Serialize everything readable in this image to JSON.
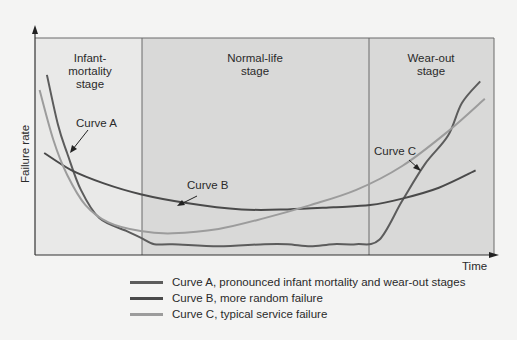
{
  "chart_data": {
    "type": "line",
    "title": "",
    "xlabel": "Time",
    "ylabel": "Failure rate",
    "grid": false,
    "legend_position": "bottom",
    "stages": [
      {
        "label": "Infant-\nmortality\nstage",
        "x_start": 0,
        "x_end": 0.233
      },
      {
        "label": "Normal-life\nstage",
        "x_start": 0.233,
        "x_end": 0.728
      },
      {
        "label": "Wear-out\nstage",
        "x_start": 0.728,
        "x_end": 1.0
      }
    ],
    "series": [
      {
        "name": "Curve A",
        "legend": "Curve A, pronounced infant mortality and wear-out stages",
        "color": "#5c5c5c",
        "points": [
          [
            0.026,
            0.83
          ],
          [
            0.05,
            0.6
          ],
          [
            0.07,
            0.47
          ],
          [
            0.1,
            0.3
          ],
          [
            0.14,
            0.17
          ],
          [
            0.2,
            0.11
          ],
          [
            0.23,
            0.08
          ],
          [
            0.26,
            0.05
          ],
          [
            0.3,
            0.05
          ],
          [
            0.4,
            0.04
          ],
          [
            0.5,
            0.05
          ],
          [
            0.55,
            0.05
          ],
          [
            0.6,
            0.04
          ],
          [
            0.65,
            0.05
          ],
          [
            0.7,
            0.05
          ],
          [
            0.75,
            0.07
          ],
          [
            0.8,
            0.25
          ],
          [
            0.85,
            0.42
          ],
          [
            0.9,
            0.55
          ],
          [
            0.93,
            0.7
          ],
          [
            0.97,
            0.8
          ]
        ]
      },
      {
        "name": "Curve B",
        "legend": "Curve B, more random failure",
        "color": "#4a4a4a",
        "points": [
          [
            0.02,
            0.47
          ],
          [
            0.08,
            0.39
          ],
          [
            0.15,
            0.33
          ],
          [
            0.23,
            0.28
          ],
          [
            0.33,
            0.24
          ],
          [
            0.45,
            0.21
          ],
          [
            0.55,
            0.21
          ],
          [
            0.65,
            0.22
          ],
          [
            0.73,
            0.23
          ],
          [
            0.8,
            0.26
          ],
          [
            0.88,
            0.31
          ],
          [
            0.96,
            0.39
          ]
        ]
      },
      {
        "name": "Curve C",
        "legend": "Curve C, typical service failure",
        "color": "#9c9c9c",
        "points": [
          [
            0.01,
            0.76
          ],
          [
            0.04,
            0.53
          ],
          [
            0.07,
            0.37
          ],
          [
            0.11,
            0.23
          ],
          [
            0.16,
            0.15
          ],
          [
            0.23,
            0.11
          ],
          [
            0.3,
            0.1
          ],
          [
            0.4,
            0.12
          ],
          [
            0.5,
            0.17
          ],
          [
            0.6,
            0.23
          ],
          [
            0.7,
            0.3
          ],
          [
            0.8,
            0.41
          ],
          [
            0.9,
            0.57
          ],
          [
            0.98,
            0.72
          ]
        ]
      }
    ],
    "annotations": [
      {
        "text": "Curve A",
        "target": "Curve A"
      },
      {
        "text": "Curve B",
        "target": "Curve B"
      },
      {
        "text": "Curve C",
        "target": "Curve C"
      }
    ]
  },
  "labels": {
    "ylabel": "Failure rate",
    "xlabel": "Time",
    "stage_infant": "Infant-\nmortality\nstage",
    "stage_normal": "Normal-life\nstage",
    "stage_wear": "Wear-out\nstage",
    "curve_a": "Curve A",
    "curve_b": "Curve B",
    "curve_c": "Curve C"
  },
  "legend": [
    {
      "text": "Curve A, pronounced infant mortality and wear-out stages",
      "color": "#5c5c5c"
    },
    {
      "text": "Curve B, more random failure",
      "color": "#4a4a4a"
    },
    {
      "text": "Curve C, typical service failure",
      "color": "#9c9c9c"
    }
  ],
  "colors": {
    "infant_bg": "#e9e9e8",
    "normal_bg": "#d9d9d8",
    "wear_bg": "#d9d9d8",
    "frame": "#6a6a6a"
  }
}
